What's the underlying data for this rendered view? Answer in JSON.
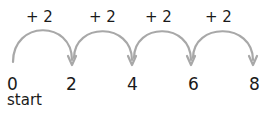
{
  "diagram": {
    "type": "number-line-jumps",
    "step_label": "+ 2",
    "jumps": [
      {
        "label": "+ 2",
        "from": "0",
        "to": "2"
      },
      {
        "label": "+ 2",
        "from": "2",
        "to": "4"
      },
      {
        "label": "+ 2",
        "from": "4",
        "to": "6"
      },
      {
        "label": "+ 2",
        "from": "6",
        "to": "8"
      }
    ],
    "numbers": [
      "0",
      "2",
      "4",
      "6",
      "8"
    ],
    "start_label": "start",
    "colors": {
      "arc": "#a8a8a8",
      "text": "#1a1a1a",
      "background": "#ffffff"
    }
  }
}
